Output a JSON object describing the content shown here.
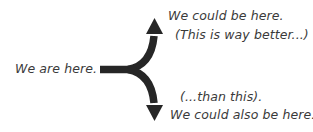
{
  "diagram": {
    "type": "fork-arrow",
    "colors": {
      "arrow": "#262626",
      "text": "#3a3a3a",
      "background": "#ffffff"
    },
    "origin": {
      "label": "We are here."
    },
    "branches": [
      {
        "direction": "up",
        "label": "We could be here.",
        "note": "(This is way better...)"
      },
      {
        "direction": "down",
        "note": "(...than this).",
        "label": "We could also be here."
      }
    ]
  }
}
